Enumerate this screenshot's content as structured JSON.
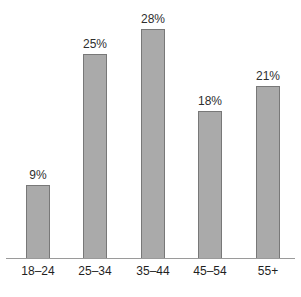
{
  "chart_data": {
    "type": "bar",
    "title": "",
    "subtitle": "",
    "xlabel": "",
    "ylabel": "",
    "categories": [
      "18–24",
      "25–34",
      "35–44",
      "45–54",
      "55+"
    ],
    "values": [
      9,
      25,
      28,
      18,
      21
    ],
    "value_labels": [
      "9%",
      "25%",
      "28%",
      "18%",
      "21%"
    ],
    "unit": "%",
    "ylim": [
      0,
      28
    ],
    "grid": false,
    "legend": false,
    "legend_position": "none",
    "axis": {
      "x_axis_visible": true,
      "y_axis_visible": false,
      "tick_marks": false
    },
    "colors": {
      "bar_fill": "#aaaaaa",
      "bar_border": "#787878",
      "axis_line": "#9a9a9a",
      "value_label_text": "#2e2e2e",
      "category_label_text": "#1f1f1f",
      "background": "#ffffff"
    }
  }
}
